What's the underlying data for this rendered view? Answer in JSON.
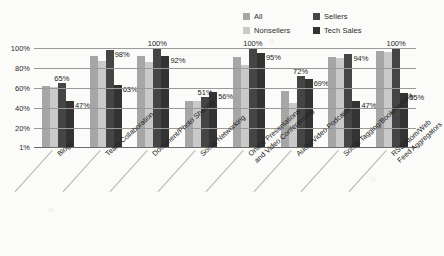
{
  "chart_data": {
    "type": "bar",
    "title": "",
    "xlabel": "",
    "ylabel": "",
    "ylim": [
      0,
      100
    ],
    "grid": true,
    "legend_position": "top-right",
    "ytick_labels": [
      "100%",
      "80%",
      "60%",
      "40%",
      "20%",
      "1%"
    ],
    "ytick_values": [
      100,
      80,
      60,
      40,
      20,
      1
    ],
    "categories": [
      "Blogs",
      "Team Collaboration",
      "Document/Photo Sharing",
      "Social Networking",
      "Online Presentations and Video Conferencing",
      "Audio/Video Podcasts",
      "Social Tagging/Bookmarking",
      "RSS/Atom/Web Feed Aggregators"
    ],
    "series": [
      {
        "name": "All",
        "color": "#a6a6a6",
        "values": [
          62,
          92,
          92,
          47,
          91,
          57,
          91,
          97
        ]
      },
      {
        "name": "Nonsellers",
        "color": "#c9c9c9",
        "values": [
          61,
          87,
          86,
          47,
          83,
          45,
          90,
          96
        ]
      },
      {
        "name": "Sellers",
        "color": "#454545",
        "values": [
          65,
          98,
          100,
          51,
          100,
          72,
          94,
          100
        ]
      },
      {
        "name": "Tech Sales",
        "color": "#333333",
        "values": [
          47,
          63,
          92,
          56,
          95,
          69,
          47,
          55
        ]
      }
    ],
    "annotations": [
      {
        "group": 0,
        "text": "65%",
        "series": "Sellers",
        "placement": "top"
      },
      {
        "group": 0,
        "text": "47%",
        "series": "Tech Sales",
        "placement": "right"
      },
      {
        "group": 1,
        "text": "98%",
        "series": "Sellers",
        "placement": "right"
      },
      {
        "group": 1,
        "text": "63%",
        "series": "Tech Sales",
        "placement": "right"
      },
      {
        "group": 2,
        "text": "100%",
        "series": "Sellers",
        "placement": "top"
      },
      {
        "group": 2,
        "text": "92%",
        "series": "Tech Sales",
        "placement": "right"
      },
      {
        "group": 3,
        "text": "51%",
        "series": "Sellers",
        "placement": "top"
      },
      {
        "group": 3,
        "text": "56%",
        "series": "Tech Sales",
        "placement": "right"
      },
      {
        "group": 4,
        "text": "100%",
        "series": "Sellers",
        "placement": "top"
      },
      {
        "group": 4,
        "text": "95%",
        "series": "Tech Sales",
        "placement": "right"
      },
      {
        "group": 5,
        "text": "72%",
        "series": "Sellers",
        "placement": "top"
      },
      {
        "group": 5,
        "text": "69%",
        "series": "Tech Sales",
        "placement": "right"
      },
      {
        "group": 6,
        "text": "94%",
        "series": "Sellers",
        "placement": "right"
      },
      {
        "group": 6,
        "text": "47%",
        "series": "Tech Sales",
        "placement": "right"
      },
      {
        "group": 7,
        "text": "100%",
        "series": "Sellers",
        "placement": "top"
      },
      {
        "group": 7,
        "text": "55%",
        "series": "Tech Sales",
        "placement": "right"
      }
    ]
  },
  "legend": {
    "entries": [
      {
        "label": "All",
        "color": "#a6a6a6"
      },
      {
        "label": "Sellers",
        "color": "#454545"
      },
      {
        "label": "Nonsellers",
        "color": "#c9c9c9"
      },
      {
        "label": "Tech Sales",
        "color": "#333333"
      }
    ]
  }
}
